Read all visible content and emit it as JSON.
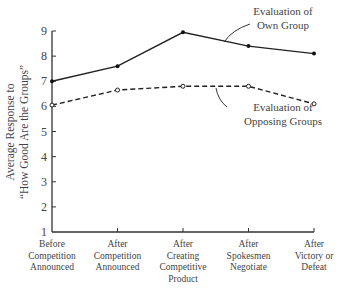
{
  "chart_data": {
    "type": "line",
    "title": "",
    "xlabel": "",
    "ylabel": "Average Response to \"How Good Are the Groups\"",
    "ylabel_lines": [
      "Average Response to",
      "“How Good Are the Groups”"
    ],
    "ylim": [
      1,
      9
    ],
    "yticks": [
      1,
      2,
      3,
      4,
      5,
      6,
      7,
      8,
      9
    ],
    "grid": false,
    "categories": [
      "Before Competition Announced",
      "After Competition Announced",
      "After Creating Competitive Product",
      "After Spokesmen Negotiate",
      "After Victory or Defeat"
    ],
    "category_lines": [
      [
        "Before",
        "Competition",
        "Announced"
      ],
      [
        "After",
        "Competition",
        "Announced"
      ],
      [
        "After",
        "Creating",
        "Competitive",
        "Product"
      ],
      [
        "After",
        "Spokesmen",
        "Negotiate"
      ],
      [
        "After",
        "Victory or",
        "Defeat"
      ]
    ],
    "series": [
      {
        "name": "Evaluation of Own Group",
        "style": "solid",
        "marker": "filled-dot",
        "values": [
          7.0,
          7.6,
          8.95,
          8.4,
          8.1
        ]
      },
      {
        "name": "Evaluation of Opposing Groups",
        "style": "dashed",
        "marker": "open-circle",
        "values": [
          6.05,
          6.65,
          6.8,
          6.8,
          6.1
        ]
      }
    ],
    "annotations": [
      {
        "text": "Evaluation of Own Group",
        "lines": [
          "Evaluation of",
          "Own Group"
        ],
        "target_series": 0
      },
      {
        "text": "Evaluation of Opposing Groups",
        "lines": [
          "Evaluation of",
          "Opposing Groups"
        ],
        "target_series": 1
      }
    ],
    "legend": "inline annotations"
  }
}
